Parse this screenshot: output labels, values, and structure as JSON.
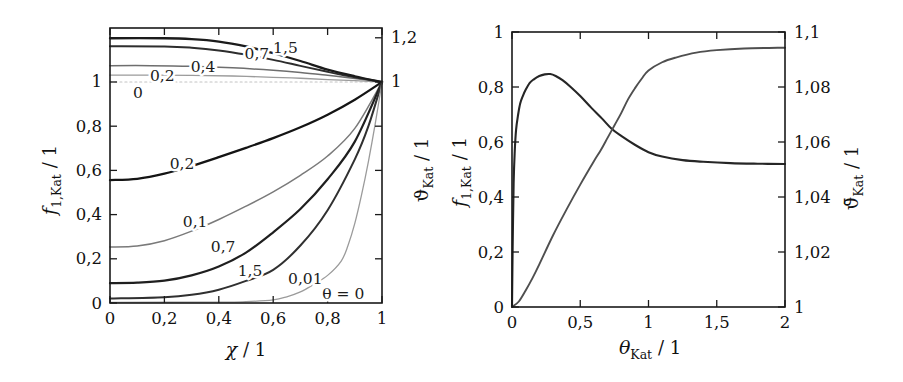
{
  "figure": {
    "background": "#ffffff",
    "frame_color": "#1a1a1a",
    "text_color": "#111111",
    "annotation_color": "#1c1c1c"
  },
  "chart_data": [
    {
      "id": "left",
      "type": "line",
      "title": "",
      "frame_px": {
        "x0": 110,
        "y0": 28,
        "x1": 382,
        "y1": 303
      },
      "x_axis": {
        "label_text": "χ / 1",
        "title": {
          "main": "χ",
          "sub": "",
          "rest": " / 1",
          "italic": true,
          "pos": [
            246,
            356
          ]
        },
        "min": 0,
        "max": 1,
        "ticks": [
          {
            "v": 0,
            "label": "0"
          },
          {
            "v": 0.2,
            "label": "0,2"
          },
          {
            "v": 0.4,
            "label": "0,4"
          },
          {
            "v": 0.6,
            "label": "0,6"
          },
          {
            "v": 0.8,
            "label": "0,8"
          },
          {
            "v": 1,
            "label": "1"
          }
        ]
      },
      "y_axis_left": {
        "label_text": "f1,Kat / 1",
        "title": {
          "main": "f",
          "sub": "1,Kat",
          "rest": " / 1",
          "italic": true,
          "pos": [
            56,
            180
          ]
        },
        "min": 0,
        "max": 1.2443,
        "ticks": [
          {
            "v": 0,
            "label": "0"
          },
          {
            "v": 0.2,
            "label": "0,2"
          },
          {
            "v": 0.4,
            "label": "0,4"
          },
          {
            "v": 0.6,
            "label": "0,6"
          },
          {
            "v": 0.8,
            "label": "0,8"
          },
          {
            "v": 1,
            "label": "1"
          }
        ]
      },
      "y_axis_right": {
        "label_text": "ϑKat / 1",
        "title": {
          "main": "ϑ",
          "sub": "Kat",
          "rest": " / 1",
          "italic": false,
          "pos": [
            428,
            170
          ]
        },
        "min": 0,
        "max": 1.2443,
        "ticks": [
          {
            "v": 0.2
          },
          {
            "v": 0.4
          },
          {
            "v": 0.6
          },
          {
            "v": 0.8
          },
          {
            "v": 1,
            "label": "1"
          },
          {
            "v": 1.2,
            "label": "1,2"
          }
        ]
      },
      "series": [
        {
          "name": "vartheta-theta-0",
          "theta": "0",
          "axis": "left",
          "color": "#c3c3c3",
          "width": 1.2,
          "dash": "2 3",
          "points": [
            [
              0,
              1
            ],
            [
              0.5,
              1
            ],
            [
              1,
              1
            ]
          ]
        },
        {
          "name": "vartheta-theta-0.2",
          "theta": "0,2",
          "axis": "left",
          "color": "#9b9b9b",
          "width": 1.3,
          "points": [
            [
              0,
              1.031
            ],
            [
              0.15,
              1.031
            ],
            [
              0.3,
              1.03
            ],
            [
              0.45,
              1.027
            ],
            [
              0.6,
              1.021
            ],
            [
              0.7,
              1.017
            ],
            [
              0.8,
              1.011
            ],
            [
              0.9,
              1.006
            ],
            [
              1,
              1
            ]
          ]
        },
        {
          "name": "vartheta-theta-0.4",
          "theta": "0,4",
          "axis": "left",
          "color": "#6e6e6e",
          "width": 1.5,
          "points": [
            [
              0,
              1.074
            ],
            [
              0.15,
              1.074
            ],
            [
              0.3,
              1.071
            ],
            [
              0.45,
              1.064
            ],
            [
              0.6,
              1.053
            ],
            [
              0.7,
              1.043
            ],
            [
              0.8,
              1.03
            ],
            [
              0.9,
              1.016
            ],
            [
              1,
              1
            ]
          ]
        },
        {
          "name": "vartheta-theta-0.7",
          "theta": "0,7",
          "axis": "left",
          "color": "#2d2d2d",
          "width": 2,
          "points": [
            [
              0,
              1.162
            ],
            [
              0.2,
              1.161
            ],
            [
              0.3,
              1.155
            ],
            [
              0.4,
              1.143
            ],
            [
              0.5,
              1.124
            ],
            [
              0.6,
              1.1
            ],
            [
              0.7,
              1.073
            ],
            [
              0.8,
              1.046
            ],
            [
              0.9,
              1.021
            ],
            [
              1,
              1
            ]
          ]
        },
        {
          "name": "vartheta-theta-1.5",
          "theta": "1,5",
          "axis": "left",
          "color": "#1b1b1b",
          "width": 2.3,
          "points": [
            [
              0,
              1.198
            ],
            [
              0.2,
              1.198
            ],
            [
              0.3,
              1.194
            ],
            [
              0.4,
              1.183
            ],
            [
              0.5,
              1.161
            ],
            [
              0.6,
              1.13
            ],
            [
              0.7,
              1.095
            ],
            [
              0.8,
              1.056
            ],
            [
              0.9,
              1.026
            ],
            [
              1,
              1
            ]
          ]
        },
        {
          "name": "f-theta-0.2",
          "theta": "0,2",
          "axis": "left",
          "color": "#141414",
          "width": 2.3,
          "points": [
            [
              0,
              0.556
            ],
            [
              0.1,
              0.562
            ],
            [
              0.2,
              0.585
            ],
            [
              0.3,
              0.62
            ],
            [
              0.4,
              0.66
            ],
            [
              0.5,
              0.702
            ],
            [
              0.6,
              0.746
            ],
            [
              0.7,
              0.795
            ],
            [
              0.8,
              0.852
            ],
            [
              0.9,
              0.92
            ],
            [
              1,
              1
            ]
          ]
        },
        {
          "name": "f-theta-0.1",
          "theta": "0,1",
          "axis": "left",
          "color": "#7a7a7a",
          "width": 1.5,
          "points": [
            [
              0,
              0.253
            ],
            [
              0.1,
              0.258
            ],
            [
              0.2,
              0.282
            ],
            [
              0.3,
              0.325
            ],
            [
              0.4,
              0.378
            ],
            [
              0.5,
              0.438
            ],
            [
              0.6,
              0.503
            ],
            [
              0.7,
              0.578
            ],
            [
              0.8,
              0.665
            ],
            [
              0.9,
              0.79
            ],
            [
              1,
              1
            ]
          ]
        },
        {
          "name": "f-theta-0.7",
          "theta": "0,7",
          "axis": "left",
          "color": "#1f1f1f",
          "width": 2.2,
          "points": [
            [
              0,
              0.09
            ],
            [
              0.1,
              0.092
            ],
            [
              0.2,
              0.101
            ],
            [
              0.3,
              0.125
            ],
            [
              0.4,
              0.165
            ],
            [
              0.5,
              0.228
            ],
            [
              0.6,
              0.32
            ],
            [
              0.7,
              0.425
            ],
            [
              0.8,
              0.56
            ],
            [
              0.9,
              0.73
            ],
            [
              1,
              1
            ]
          ]
        },
        {
          "name": "f-theta-1.5",
          "theta": "1,5",
          "axis": "left",
          "color": "#303030",
          "width": 2,
          "points": [
            [
              0,
              0.02
            ],
            [
              0.2,
              0.026
            ],
            [
              0.3,
              0.037
            ],
            [
              0.4,
              0.06
            ],
            [
              0.5,
              0.1
            ],
            [
              0.6,
              0.15
            ],
            [
              0.7,
              0.26
            ],
            [
              0.8,
              0.42
            ],
            [
              0.9,
              0.65
            ],
            [
              0.95,
              0.8
            ],
            [
              1,
              1
            ]
          ]
        },
        {
          "name": "f-theta-0.01",
          "theta": "0,01",
          "axis": "left",
          "color": "#9b9b9b",
          "width": 1.3,
          "points": [
            [
              0,
              0.003
            ],
            [
              0.4,
              0.004
            ],
            [
              0.5,
              0.006
            ],
            [
              0.6,
              0.014
            ],
            [
              0.65,
              0.028
            ],
            [
              0.7,
              0.05
            ],
            [
              0.75,
              0.085
            ],
            [
              0.8,
              0.125
            ],
            [
              0.85,
              0.19
            ],
            [
              0.875,
              0.26
            ],
            [
              0.9,
              0.36
            ],
            [
              0.925,
              0.49
            ],
            [
              0.95,
              0.64
            ],
            [
              0.975,
              0.81
            ],
            [
              1,
              1
            ]
          ]
        }
      ],
      "annotations": [
        {
          "text": "1,5",
          "x": 0.645,
          "v": 1.152
        },
        {
          "text": "0,7",
          "x": 0.54,
          "v": 1.126
        },
        {
          "text": "0,4",
          "x": 0.342,
          "v": 1.066
        },
        {
          "text": "0,2",
          "x": 0.192,
          "v": 1.029
        },
        {
          "text": "0",
          "x": 0.103,
          "v": 0.952
        },
        {
          "text": "0,2",
          "x": 0.265,
          "v": 0.628
        },
        {
          "text": "0,1",
          "x": 0.313,
          "v": 0.368
        },
        {
          "text": "0,7",
          "x": 0.416,
          "v": 0.252
        },
        {
          "text": "1,5",
          "x": 0.515,
          "v": 0.143
        },
        {
          "text": "0,01",
          "x": 0.718,
          "v": 0.108
        },
        {
          "text": "θ = 0",
          "x": 0.858,
          "v": 0.04
        }
      ]
    },
    {
      "id": "right",
      "type": "line",
      "title": "",
      "frame_px": {
        "x0": 512,
        "y0": 32,
        "x1": 785,
        "y1": 307
      },
      "x_axis": {
        "label_text": "θKat / 1",
        "title": {
          "main": "θ",
          "sub": "Kat",
          "rest": " / 1",
          "italic": true,
          "pos": [
            650,
            354
          ]
        },
        "min": 0,
        "max": 2,
        "ticks": [
          {
            "v": 0,
            "label": "0"
          },
          {
            "v": 0.5,
            "label": "0,5"
          },
          {
            "v": 1,
            "label": "1"
          },
          {
            "v": 1.5,
            "label": "1,5"
          },
          {
            "v": 2,
            "label": "2"
          }
        ]
      },
      "y_axis_left": {
        "label_text": "f1,Kat / 1",
        "title": {
          "main": "f",
          "sub": "1,Kat",
          "rest": " / 1",
          "italic": true,
          "pos": [
            466,
            172
          ]
        },
        "min": 0,
        "max": 1,
        "ticks": [
          {
            "v": 0,
            "label": "0"
          },
          {
            "v": 0.2,
            "label": "0,2"
          },
          {
            "v": 0.4,
            "label": "0,4"
          },
          {
            "v": 0.6,
            "label": "0,6"
          },
          {
            "v": 0.8,
            "label": "0,8"
          },
          {
            "v": 1,
            "label": "1"
          }
        ]
      },
      "y_axis_right": {
        "label_text": "ϑ̄Kat / 1",
        "title": {
          "main": "ϑ̄",
          "sub": "Kat",
          "rest": " / 1",
          "italic": false,
          "pos": [
            858,
            178
          ]
        },
        "min": 1,
        "max": 1.1,
        "ticks": [
          {
            "v": 1,
            "label": "1"
          },
          {
            "v": 1.02,
            "label": "1,02"
          },
          {
            "v": 1.04,
            "label": "1,04"
          },
          {
            "v": 1.06,
            "label": "1,06"
          },
          {
            "v": 1.08,
            "label": "1,08"
          },
          {
            "v": 1.1,
            "label": "1,1"
          }
        ]
      },
      "series": [
        {
          "name": "f-1-kat",
          "axis": "left",
          "color": "#262626",
          "width": 2.1,
          "points": [
            [
              0,
              0
            ],
            [
              0.005,
              0.22
            ],
            [
              0.012,
              0.45
            ],
            [
              0.02,
              0.565
            ],
            [
              0.03,
              0.645
            ],
            [
              0.045,
              0.7
            ],
            [
              0.06,
              0.74
            ],
            [
              0.08,
              0.768
            ],
            [
              0.1,
              0.79
            ],
            [
              0.13,
              0.815
            ],
            [
              0.16,
              0.828
            ],
            [
              0.2,
              0.84
            ],
            [
              0.24,
              0.846
            ],
            [
              0.28,
              0.847
            ],
            [
              0.32,
              0.84
            ],
            [
              0.37,
              0.825
            ],
            [
              0.43,
              0.8
            ],
            [
              0.5,
              0.767
            ],
            [
              0.58,
              0.725
            ],
            [
              0.66,
              0.685
            ],
            [
              0.73,
              0.648
            ],
            [
              0.8,
              0.622
            ],
            [
              0.9,
              0.59
            ],
            [
              1,
              0.563
            ],
            [
              1.1,
              0.547
            ],
            [
              1.25,
              0.534
            ],
            [
              1.4,
              0.528
            ],
            [
              1.6,
              0.523
            ],
            [
              1.8,
              0.521
            ],
            [
              2,
              0.52
            ]
          ]
        },
        {
          "name": "vartheta-mean-kat",
          "axis": "right",
          "color": "#4f4f4f",
          "width": 1.9,
          "points": [
            [
              0,
              1
            ],
            [
              0.05,
              1.002
            ],
            [
              0.1,
              1.006
            ],
            [
              0.15,
              1.0105
            ],
            [
              0.2,
              1.0155
            ],
            [
              0.3,
              1.026
            ],
            [
              0.4,
              1.0355
            ],
            [
              0.5,
              1.0445
            ],
            [
              0.6,
              1.053
            ],
            [
              0.65,
              1.057
            ],
            [
              0.7,
              1.0615
            ],
            [
              0.75,
              1.066
            ],
            [
              0.8,
              1.0705
            ],
            [
              0.85,
              1.0755
            ],
            [
              0.9,
              1.0795
            ],
            [
              0.95,
              1.083
            ],
            [
              1,
              1.086
            ],
            [
              1.1,
              1.089
            ],
            [
              1.2,
              1.0907
            ],
            [
              1.35,
              1.0925
            ],
            [
              1.5,
              1.0934
            ],
            [
              1.7,
              1.094
            ],
            [
              2,
              1.0943
            ]
          ]
        },
        {
          "name": "annotations-none",
          "axis": "left",
          "color": "#000000",
          "width": 0,
          "points": []
        }
      ],
      "annotations": []
    }
  ]
}
